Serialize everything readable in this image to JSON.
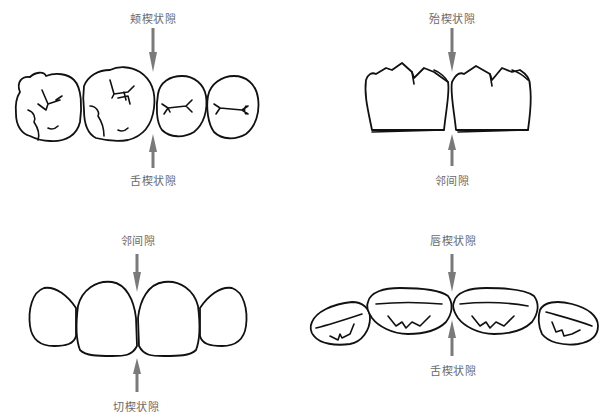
{
  "panels": [
    {
      "id": "posterior-occlusal",
      "view": "occlusal view of posterior teeth",
      "top_label": "颊楔状隙",
      "bottom_label": "舌楔状隙"
    },
    {
      "id": "posterior-buccal",
      "view": "buccal view of posterior teeth",
      "top_label": "殆楔状隙",
      "bottom_label": "邻间隙"
    },
    {
      "id": "anterior-labial",
      "view": "labial view of anterior teeth",
      "top_label": "邻间隙",
      "bottom_label": "切楔状隙"
    },
    {
      "id": "anterior-incisal",
      "view": "incisal view of anterior teeth",
      "top_label": "唇楔状隙",
      "bottom_label": "舌楔状隙"
    }
  ],
  "colors": {
    "outline": "#111111",
    "arrow": "#7a7a7a",
    "label": "#6a6a6a",
    "background": "#ffffff"
  }
}
